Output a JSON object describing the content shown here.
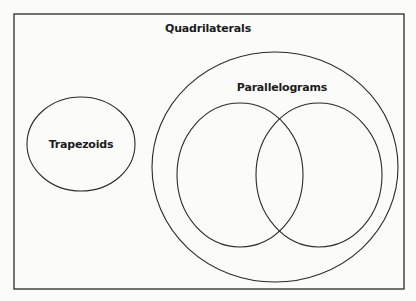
{
  "diagram": {
    "type": "venn",
    "colors": {
      "background": "#fbfbfa",
      "stroke": "#2a2a2a",
      "text": "#1c1c1c"
    },
    "universe": {
      "label": "Quadrilaterals",
      "label_pos": {
        "x": 208,
        "y": 28
      },
      "rect": {
        "x": 14,
        "y": 14,
        "width": 390,
        "height": 275
      }
    },
    "sets": [
      {
        "id": "trapezoids",
        "label": "Trapezoids",
        "label_pos": {
          "x": 81,
          "y": 144
        },
        "ellipse": {
          "cx": 81,
          "cy": 144,
          "rx": 54,
          "ry": 47
        }
      },
      {
        "id": "parallelograms",
        "label": "Parallelograms",
        "label_pos": {
          "x": 282,
          "y": 87
        },
        "ellipse": {
          "cx": 275,
          "cy": 167,
          "rx": 123,
          "ry": 115
        }
      },
      {
        "id": "subset-left",
        "label": "",
        "ellipse": {
          "cx": 240,
          "cy": 175,
          "rx": 63,
          "ry": 72
        }
      },
      {
        "id": "subset-right",
        "label": "",
        "ellipse": {
          "cx": 319,
          "cy": 175,
          "rx": 63,
          "ry": 72
        }
      }
    ]
  }
}
